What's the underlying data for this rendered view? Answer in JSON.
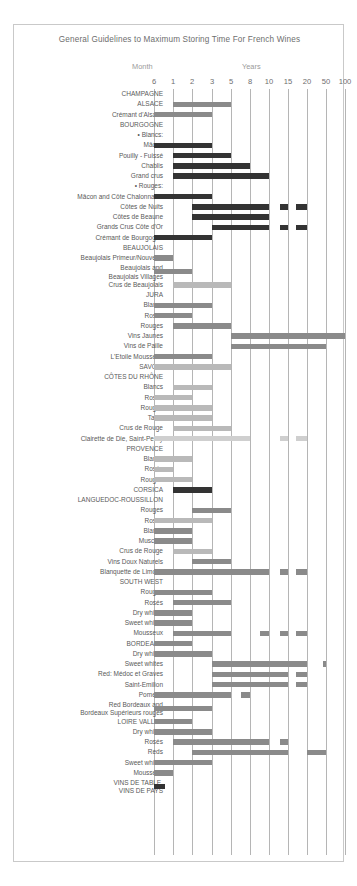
{
  "title": "General Guidelines to Maximum Storing Time For French Wines",
  "axis": {
    "group_labels": [
      {
        "name": "month",
        "text": "Month"
      },
      {
        "name": "years",
        "text": "Years"
      }
    ],
    "ticks": [
      "6",
      "1",
      "2",
      "3",
      "5",
      "8",
      "10",
      "15",
      "20",
      "50",
      "100"
    ],
    "tick_positions_px": [
      153,
      172,
      191,
      211,
      230,
      249,
      268,
      287,
      306,
      325,
      344
    ]
  },
  "colors": {
    "frame": "#c9c9c9",
    "grid": "#b5b5b5",
    "text": "#585858",
    "title": "#6e6e6e",
    "bar_dark": "#333333",
    "bar_mid": "#8a8a8a",
    "bar_light": "#b9b9b9",
    "bar_pale": "#cfcfcf",
    "background": "#ffffff"
  },
  "chart_data": {
    "type": "bar",
    "title": "General Guidelines to Maximum Storing Time For French Wines",
    "xlabel": "Storing time",
    "ylabel": "",
    "scale": "ordinal-log: 6 months, 1, 2, 3, 5, 8, 10, 15, 20, 50, 100 years",
    "categories": [
      "6",
      "1",
      "2",
      "3",
      "5",
      "8",
      "10",
      "15",
      "20",
      "50",
      "100"
    ],
    "grid": true,
    "legend": "none",
    "rows": [
      {
        "label": "CHAMPAGNE",
        "header": true,
        "bars": []
      },
      {
        "label": "ALSACE",
        "header": true,
        "bars": [
          {
            "start": "1",
            "end": "5",
            "shade": "mid"
          }
        ]
      },
      {
        "label": "Crémant d'Alsace",
        "bars": [
          {
            "start": "6",
            "end": "3",
            "shade": "mid"
          }
        ]
      },
      {
        "label": "BOURGOGNE",
        "header": true,
        "bars": []
      },
      {
        "label": "• Blancs:",
        "bars": []
      },
      {
        "label": "Mâcon",
        "bars": [
          {
            "start": "6",
            "end": "3",
            "shade": "dark"
          }
        ]
      },
      {
        "label": "Pouilly - Fuissé",
        "bars": [
          {
            "start": "1",
            "end": "5",
            "shade": "dark"
          }
        ]
      },
      {
        "label": "Chablis",
        "bars": [
          {
            "start": "1",
            "end": "8",
            "shade": "dark"
          }
        ]
      },
      {
        "label": "Grand crus",
        "bars": [
          {
            "start": "1",
            "end": "10",
            "shade": "dark"
          }
        ]
      },
      {
        "label": "• Rouges:",
        "bars": []
      },
      {
        "label": "Mâcon and Côte Chalonnaise",
        "bars": [
          {
            "start": "6",
            "end": "3",
            "shade": "dark"
          }
        ]
      },
      {
        "label": "Côtes de Nuits",
        "bars": [
          {
            "start": "2",
            "end": "10",
            "shade": "dark"
          },
          {
            "start": "13",
            "end": "15",
            "shade": "dark"
          },
          {
            "start": "17",
            "end": "20",
            "shade": "dark"
          }
        ]
      },
      {
        "label": "Côtes de Beaune",
        "bars": [
          {
            "start": "2",
            "end": "10",
            "shade": "dark"
          }
        ]
      },
      {
        "label": "Grands Crus Côte d'Or",
        "bars": [
          {
            "start": "3",
            "end": "10",
            "shade": "dark"
          },
          {
            "start": "13",
            "end": "15",
            "shade": "dark"
          },
          {
            "start": "17",
            "end": "20",
            "shade": "dark"
          }
        ]
      },
      {
        "label": "Crémant de Bourgogne",
        "bars": [
          {
            "start": "6",
            "end": "3",
            "shade": "dark"
          }
        ]
      },
      {
        "label": "BEAUJOLAIS",
        "header": true,
        "bars": []
      },
      {
        "label": "Beaujolais Primeur/Nouveau",
        "bars": [
          {
            "start": "6",
            "end": "1",
            "shade": "mid"
          }
        ]
      },
      {
        "label": "Beaujolais and\nBeaujolais Villages",
        "two_line": true,
        "bars": [
          {
            "start": "6",
            "end": "2",
            "shade": "mid"
          }
        ]
      },
      {
        "label": "Crus de Beaujolais",
        "bars": [
          {
            "start": "1",
            "end": "5",
            "shade": "light"
          }
        ]
      },
      {
        "label": "JURA",
        "header": true,
        "bars": []
      },
      {
        "label": "Blancs",
        "bars": [
          {
            "start": "6",
            "end": "3",
            "shade": "mid"
          }
        ]
      },
      {
        "label": "Rosés",
        "bars": [
          {
            "start": "6",
            "end": "2",
            "shade": "mid"
          }
        ]
      },
      {
        "label": "Rouges",
        "bars": [
          {
            "start": "1",
            "end": "5",
            "shade": "mid"
          }
        ]
      },
      {
        "label": "Vins Jaunes",
        "bars": [
          {
            "start": "5",
            "end": "100",
            "shade": "mid"
          }
        ]
      },
      {
        "label": "Vins de Paille",
        "bars": [
          {
            "start": "5",
            "end": "50",
            "shade": "mid"
          }
        ]
      },
      {
        "label": "L'Etoile Mousseux",
        "bars": [
          {
            "start": "6",
            "end": "3",
            "shade": "mid"
          }
        ]
      },
      {
        "label": "SAVOIE",
        "header": true,
        "bars": [
          {
            "start": "6",
            "end": "5",
            "shade": "light"
          }
        ]
      },
      {
        "label": "CÔTES DU RHÔNE",
        "header": true,
        "bars": []
      },
      {
        "label": "Blancs",
        "bars": [
          {
            "start": "1",
            "end": "3",
            "shade": "light"
          }
        ]
      },
      {
        "label": "Rosés",
        "bars": [
          {
            "start": "6",
            "end": "2",
            "shade": "light"
          }
        ]
      },
      {
        "label": "Rouges",
        "bars": [
          {
            "start": "6",
            "end": "3",
            "shade": "light"
          }
        ]
      },
      {
        "label": "Tavel",
        "bars": [
          {
            "start": "6",
            "end": "3",
            "shade": "light"
          }
        ]
      },
      {
        "label": "Crus de Rouge",
        "bars": [
          {
            "start": "1",
            "end": "5",
            "shade": "light"
          }
        ]
      },
      {
        "label": "Clairette de Die, Saint-Peray",
        "bars": [
          {
            "start": "6",
            "end": "8",
            "shade": "pale"
          },
          {
            "start": "13",
            "end": "15",
            "shade": "pale"
          },
          {
            "start": "17",
            "end": "20",
            "shade": "pale"
          }
        ]
      },
      {
        "label": "PROVENCE",
        "header": true,
        "bars": []
      },
      {
        "label": "Blancs",
        "bars": [
          {
            "start": "6",
            "end": "2",
            "shade": "light"
          }
        ]
      },
      {
        "label": "Rosés",
        "bars": [
          {
            "start": "6",
            "end": "1",
            "shade": "light"
          }
        ]
      },
      {
        "label": "Rouges",
        "bars": [
          {
            "start": "6",
            "end": "2",
            "shade": "light"
          }
        ]
      },
      {
        "label": "CORSICA",
        "header": true,
        "bars": [
          {
            "start": "1",
            "end": "3",
            "shade": "dark"
          }
        ]
      },
      {
        "label": "LANGUEDOC-ROUSSILLON",
        "header": true,
        "bars": []
      },
      {
        "label": "Rouges",
        "bars": [
          {
            "start": "2",
            "end": "5",
            "shade": "mid"
          }
        ]
      },
      {
        "label": "Rosés",
        "bars": [
          {
            "start": "6",
            "end": "3",
            "shade": "light"
          }
        ]
      },
      {
        "label": "Blancs",
        "bars": [
          {
            "start": "6",
            "end": "2",
            "shade": "mid"
          }
        ]
      },
      {
        "label": "Muscats",
        "bars": [
          {
            "start": "6",
            "end": "2",
            "shade": "mid"
          }
        ]
      },
      {
        "label": "Crus de Rouge",
        "bars": [
          {
            "start": "1",
            "end": "3",
            "shade": "light"
          }
        ]
      },
      {
        "label": "Vins Doux Naturels",
        "bars": [
          {
            "start": "2",
            "end": "5",
            "shade": "mid"
          }
        ]
      },
      {
        "label": "Blanquette de Limoux",
        "bars": [
          {
            "start": "6",
            "end": "10",
            "shade": "mid"
          },
          {
            "start": "13",
            "end": "15",
            "shade": "mid"
          },
          {
            "start": "17",
            "end": "20",
            "shade": "mid"
          }
        ]
      },
      {
        "label": "SOUTH WEST",
        "header": true,
        "bars": []
      },
      {
        "label": "Rouges",
        "bars": [
          {
            "start": "6",
            "end": "3",
            "shade": "mid"
          }
        ]
      },
      {
        "label": "Rosés",
        "bars": [
          {
            "start": "1",
            "end": "5",
            "shade": "mid"
          }
        ]
      },
      {
        "label": "Dry whites",
        "bars": [
          {
            "start": "6",
            "end": "2",
            "shade": "mid"
          }
        ]
      },
      {
        "label": "Sweet whites",
        "bars": [
          {
            "start": "6",
            "end": "2",
            "shade": "mid"
          }
        ]
      },
      {
        "label": "Mousseux",
        "bars": [
          {
            "start": "1",
            "end": "5",
            "shade": "mid"
          },
          {
            "start": "9",
            "end": "10",
            "shade": "mid"
          },
          {
            "start": "13",
            "end": "15",
            "shade": "mid"
          },
          {
            "start": "17",
            "end": "20",
            "shade": "mid"
          }
        ]
      },
      {
        "label": "BORDEAUX",
        "header": true,
        "bars": [
          {
            "start": "6",
            "end": "2",
            "shade": "mid"
          }
        ]
      },
      {
        "label": "Dry whites",
        "bars": [
          {
            "start": "6",
            "end": "3",
            "shade": "mid"
          }
        ]
      },
      {
        "label": "Sweet whites",
        "bars": [
          {
            "start": "3",
            "end": "20",
            "shade": "mid"
          },
          {
            "start": "45",
            "end": "50",
            "shade": "mid"
          }
        ]
      },
      {
        "label": "Red: Médoc et Graves",
        "bars": [
          {
            "start": "3",
            "end": "15",
            "shade": "mid"
          },
          {
            "start": "17",
            "end": "20",
            "shade": "mid"
          }
        ]
      },
      {
        "label": "Saint-Emilion",
        "bars": [
          {
            "start": "3",
            "end": "15",
            "shade": "mid"
          },
          {
            "start": "17",
            "end": "20",
            "shade": "mid"
          }
        ]
      },
      {
        "label": "Pomerol",
        "bars": [
          {
            "start": "6",
            "end": "5",
            "shade": "mid"
          },
          {
            "start": "6.5",
            "end": "8",
            "shade": "mid"
          }
        ]
      },
      {
        "label": "Red Bordeaux and\nBordeaux Supérieurs rouges",
        "two_line": true,
        "bars": [
          {
            "start": "6",
            "end": "3",
            "shade": "mid"
          }
        ]
      },
      {
        "label": "LOIRE VALLEY",
        "header": true,
        "bars": [
          {
            "start": "6",
            "end": "2",
            "shade": "mid"
          }
        ]
      },
      {
        "label": "Dry whites",
        "bars": [
          {
            "start": "6",
            "end": "3",
            "shade": "mid"
          }
        ]
      },
      {
        "label": "Rosés",
        "bars": [
          {
            "start": "1",
            "end": "10",
            "shade": "mid"
          },
          {
            "start": "13",
            "end": "15",
            "shade": "mid"
          }
        ]
      },
      {
        "label": "Reds",
        "bars": [
          {
            "start": "2",
            "end": "15",
            "shade": "mid"
          },
          {
            "start": "20",
            "end": "50",
            "shade": "mid"
          }
        ]
      },
      {
        "label": "Sweet whites",
        "bars": [
          {
            "start": "6",
            "end": "3",
            "shade": "mid"
          }
        ]
      },
      {
        "label": "Mousseux",
        "bars": [
          {
            "start": "6",
            "end": "1",
            "shade": "mid"
          }
        ]
      },
      {
        "label": "VINS DE TABLE,\nVINS DE PAYS",
        "two_line": true,
        "bars": [
          {
            "start": "6",
            "end": "0.8",
            "shade": "dark"
          }
        ]
      }
    ]
  }
}
